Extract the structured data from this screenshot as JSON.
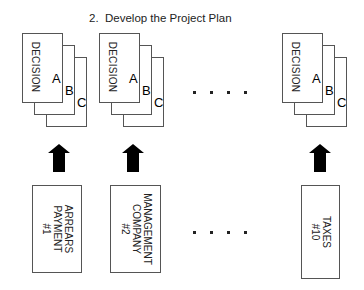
{
  "title": "2.  Develop the Project Plan",
  "stacks": [
    {
      "label": "DECISION",
      "letters": [
        "A",
        "B",
        "C"
      ]
    },
    {
      "label": "DECISION",
      "letters": [
        "A",
        "B",
        "C"
      ]
    },
    {
      "label": "DECISION",
      "letters": [
        "A",
        "B",
        "C"
      ]
    }
  ],
  "ellipsis": ". . . .",
  "inputs": [
    {
      "lines": [
        "ARREARS",
        "PAYMENT",
        "#1"
      ]
    },
    {
      "lines": [
        "MANAGEMENT",
        "COMPANY",
        "#2"
      ]
    },
    {
      "lines": [
        "TAXES",
        "#10"
      ]
    }
  ],
  "icons": {
    "arrow": "up-arrow-icon"
  },
  "colors": {
    "stroke": "#555555",
    "fill": "#000000"
  }
}
